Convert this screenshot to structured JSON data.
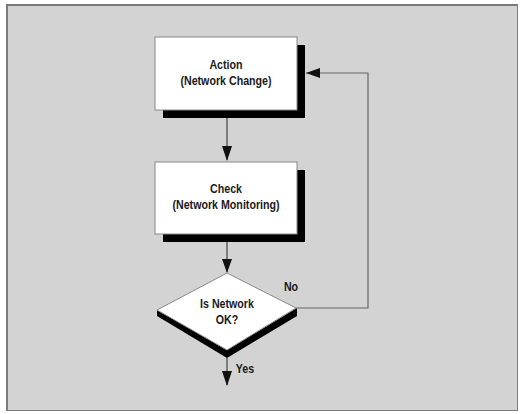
{
  "diagram": {
    "type": "flowchart",
    "nodes": [
      {
        "id": "action",
        "shape": "rectangle",
        "line1": "Action",
        "line2": "(Network Change)"
      },
      {
        "id": "check",
        "shape": "rectangle",
        "line1": "Check",
        "line2": "(Network Monitoring)"
      },
      {
        "id": "decision",
        "shape": "diamond",
        "line1": "Is Network",
        "line2": "OK?"
      }
    ],
    "edges": [
      {
        "from": "action",
        "to": "check",
        "label": ""
      },
      {
        "from": "check",
        "to": "decision",
        "label": ""
      },
      {
        "from": "decision",
        "to": "action",
        "label": "No"
      },
      {
        "from": "decision",
        "to": "exit",
        "label": "Yes"
      }
    ],
    "labels": {
      "no": "No",
      "yes": "Yes"
    }
  },
  "colors": {
    "background": "#d3d3d3",
    "node_fill": "#ffffff",
    "shadow": "#000000",
    "line": "#555555"
  }
}
